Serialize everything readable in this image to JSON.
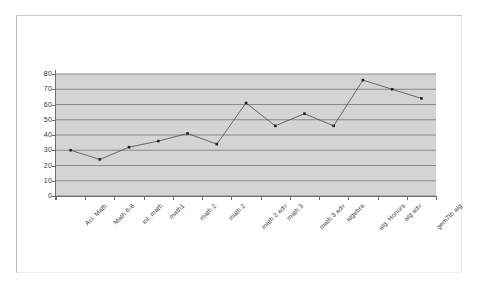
{
  "document": {
    "kind": "scanned-page-with-chart"
  },
  "chart_data": {
    "type": "line",
    "title": "",
    "subtitle": "",
    "xlabel": "",
    "ylabel": "",
    "categories": [
      "Acl. Math",
      "Math 6-8",
      "int. math",
      "math1",
      "math 2",
      "math 2",
      "math 2 adv",
      "math 3",
      "math 3 adv",
      "algebra",
      "alg. Honors",
      "alg adv",
      "gem7th alg"
    ],
    "values": [
      30,
      24,
      32,
      36,
      41,
      34,
      61,
      46,
      54,
      46,
      76,
      70,
      64
    ],
    "series": [
      {
        "name": "Series 1",
        "values": [
          30,
          24,
          32,
          36,
          41,
          34,
          61,
          46,
          54,
          46,
          76,
          70,
          64
        ]
      }
    ],
    "ylim": [
      0,
      80
    ],
    "ytick_labels": [
      "80",
      "70",
      "60",
      "50",
      "40",
      "30",
      "20",
      "10",
      "0"
    ],
    "ytick_values": [
      80,
      70,
      60,
      50,
      40,
      30,
      20,
      10,
      0
    ],
    "ytick_step": 10,
    "grid": true,
    "grid_axis": "y",
    "legend": false,
    "legend_position": "none",
    "plot_background_color": "#d4d4d4",
    "line_color": "#4a4a4a",
    "marker_color": "#222222",
    "marker_shape": "square",
    "gridline_color": "#808080",
    "axis_color": "#6d6d6d",
    "xtick_label_rotation": -45
  }
}
